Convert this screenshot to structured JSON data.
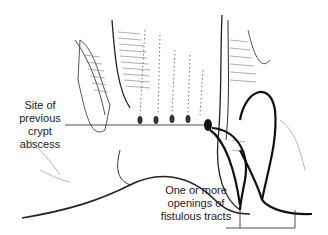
{
  "figure": {
    "labels": {
      "crypt_abscess": [
        "Site of",
        "previous",
        "crypt",
        "abscess"
      ],
      "fistula_openings": [
        "One or more",
        "openings of",
        "fistulous tracts"
      ]
    },
    "colors": {
      "ink": "#1a1a1a",
      "background": "#ffffff"
    }
  }
}
